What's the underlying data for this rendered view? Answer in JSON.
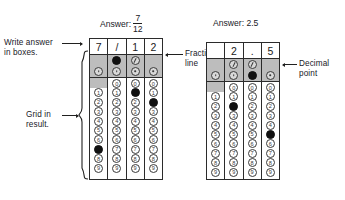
{
  "figure": {
    "title_left": "Answer:",
    "title_right": "Answer: 2.5"
  },
  "annotations": {
    "write_answer": "Write answer\nin boxes.",
    "grid_in_result": "Grid in\nresult.",
    "fraction_line": "Fraction\nline",
    "decimal_point": "Decimal\npoint"
  },
  "grids": [
    {
      "id": "grid-fraction",
      "answer_label": "Answer:",
      "answer_kind": "fraction",
      "answer_numerator": "7",
      "answer_denominator": "12",
      "answer_text": "7/12",
      "written": [
        "7",
        "/",
        "1",
        "2"
      ],
      "columns": [
        {
          "index": 1,
          "written": "7",
          "slash_bubble": "none",
          "decimal_bubble": "open",
          "zero_bubble": "none",
          "digits": [
            "1",
            "2",
            "3",
            "4",
            "5",
            "6",
            "7",
            "8",
            "9"
          ],
          "filled_digit": "7"
        },
        {
          "index": 2,
          "written": "/",
          "slash_bubble": "filled",
          "decimal_bubble": "open",
          "zero_bubble": "open",
          "digits": [
            "0",
            "1",
            "2",
            "3",
            "4",
            "5",
            "6",
            "7",
            "8",
            "9"
          ],
          "filled_digit": null
        },
        {
          "index": 3,
          "written": "1",
          "slash_bubble": "open",
          "decimal_bubble": "open",
          "zero_bubble": "open",
          "digits": [
            "0",
            "1",
            "2",
            "3",
            "4",
            "5",
            "6",
            "7",
            "8",
            "9"
          ],
          "filled_digit": "1"
        },
        {
          "index": 4,
          "written": "2",
          "slash_bubble": "none",
          "decimal_bubble": "open",
          "zero_bubble": "open",
          "digits": [
            "0",
            "1",
            "2",
            "3",
            "4",
            "5",
            "6",
            "7",
            "8",
            "9"
          ],
          "filled_digit": "2"
        }
      ]
    },
    {
      "id": "grid-decimal",
      "answer_label": "Answer: 2.5",
      "answer_kind": "decimal",
      "answer_text": "2.5",
      "written": [
        "",
        "2",
        ".",
        "5"
      ],
      "columns": [
        {
          "index": 1,
          "written": "",
          "slash_bubble": "none",
          "decimal_bubble": "open",
          "zero_bubble": "none",
          "digits": [
            "1",
            "2",
            "3",
            "4",
            "5",
            "6",
            "7",
            "8",
            "9"
          ],
          "filled_digit": null
        },
        {
          "index": 2,
          "written": "2",
          "slash_bubble": "open",
          "decimal_bubble": "open",
          "zero_bubble": "open",
          "digits": [
            "0",
            "1",
            "2",
            "3",
            "4",
            "5",
            "6",
            "7",
            "8",
            "9"
          ],
          "filled_digit": "2"
        },
        {
          "index": 3,
          "written": ".",
          "slash_bubble": "open",
          "decimal_bubble": "filled",
          "zero_bubble": "open",
          "digits": [
            "0",
            "1",
            "2",
            "3",
            "4",
            "5",
            "6",
            "7",
            "8",
            "9"
          ],
          "filled_digit": null
        },
        {
          "index": 4,
          "written": "5",
          "slash_bubble": "none",
          "decimal_bubble": "open",
          "zero_bubble": "open",
          "digits": [
            "0",
            "1",
            "2",
            "3",
            "4",
            "5",
            "6",
            "7",
            "8",
            "9"
          ],
          "filled_digit": "5"
        }
      ]
    }
  ],
  "colors": {
    "ink": "#20201f",
    "band": "#bdbdbd",
    "filled": "#111111",
    "paper": "#ffffff"
  }
}
